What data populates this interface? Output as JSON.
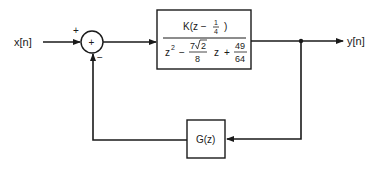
{
  "diagram": {
    "type": "feedback-block-diagram",
    "input_label": "x[n]",
    "output_label": "y[n]",
    "summing_junction": {
      "symbol": "+",
      "input_sign_forward": "+",
      "input_sign_feedback": "−"
    },
    "forward_block": {
      "numerator": {
        "gain": "K",
        "expr_prefix": "K(z −",
        "frac_num": "1",
        "frac_den": "4",
        "expr_suffix": ")"
      },
      "denominator": {
        "term1": "z",
        "term1_exp": "2",
        "minus": "−",
        "coef_num_a": "7",
        "coef_num_b": "2",
        "coef_den": "8",
        "term2": "z",
        "plus": "+",
        "const_num": "49",
        "const_den": "64"
      }
    },
    "feedback_block": {
      "label": "G(z)"
    },
    "colors": {
      "line": "#1a1a1a",
      "background": "#ffffff"
    }
  }
}
